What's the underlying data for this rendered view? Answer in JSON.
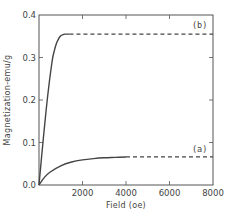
{
  "chart_data": {
    "type": "line",
    "title": "",
    "xlabel": "Field (oe)",
    "ylabel": "Magnetization-emu/g",
    "xlim": [
      0,
      8000
    ],
    "ylim": [
      0.0,
      0.4
    ],
    "x_ticks": [
      2000,
      4000,
      6000,
      8000
    ],
    "x_tick_labels": [
      "2000",
      "4000",
      "6000",
      "8000"
    ],
    "y_ticks": [
      0.0,
      0.1,
      0.2,
      0.3,
      0.4
    ],
    "y_tick_labels": [
      "0.0",
      "0.1",
      "0.2",
      "0.3",
      "0.4"
    ],
    "grid": false,
    "legend": "none (inline series labels)",
    "series": [
      {
        "name": "(b)",
        "label": "(b)",
        "solid": {
          "x": [
            0,
            200,
            400,
            600,
            700,
            800,
            900,
            1000,
            1100,
            1200,
            1400
          ],
          "y": [
            0.0,
            0.11,
            0.21,
            0.29,
            0.315,
            0.333,
            0.344,
            0.351,
            0.354,
            0.355,
            0.355
          ]
        },
        "dashed": {
          "x": [
            1400,
            8000
          ],
          "y": [
            0.355,
            0.355
          ]
        }
      },
      {
        "name": "(a)",
        "label": "(a)",
        "solid": {
          "x": [
            0,
            250,
            500,
            1000,
            1500,
            2000,
            2500,
            3000,
            3500,
            4000
          ],
          "y": [
            0.0,
            0.018,
            0.03,
            0.045,
            0.054,
            0.059,
            0.062,
            0.064,
            0.065,
            0.066
          ]
        },
        "dashed": {
          "x": [
            4000,
            8000
          ],
          "y": [
            0.066,
            0.066
          ]
        }
      }
    ]
  }
}
